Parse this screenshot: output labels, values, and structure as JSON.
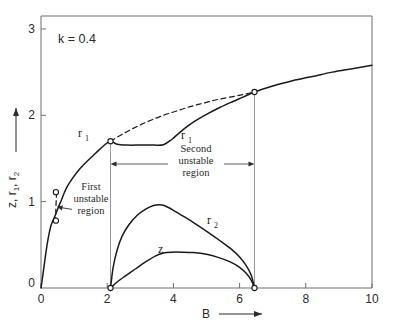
{
  "figure": {
    "background": "#ffffff",
    "ink": "#1a1a1a",
    "axis_color": "#6e6e6e"
  },
  "annotations": {
    "parameter": "k = 0.4",
    "first_region_line1": "First",
    "first_region_line2": "unstable",
    "first_region_line3": "region",
    "second_region_line1": "Second",
    "second_region_line2": "unstable",
    "second_region_line3": "region",
    "label_r1_left": "r",
    "label_r1_left_sub": "1",
    "label_r1_right": "r",
    "label_r1_right_sub": "1",
    "label_r2": "r",
    "label_r2_sub": "2",
    "label_z": "z"
  },
  "axes": {
    "x_title": "B",
    "y_title_parts": [
      "z",
      ", ",
      "r",
      "1",
      ", ",
      "r",
      "2"
    ],
    "y_title_flat": "z , r1 , r2",
    "x_ticks": [
      "0",
      "2",
      "4",
      "6",
      "8",
      "10"
    ],
    "y_ticks": [
      "0",
      "1",
      "2",
      "3"
    ],
    "x_origin_label": "0",
    "y_origin_label": "0"
  },
  "chart_data": {
    "type": "line",
    "title": "",
    "xlabel": "B",
    "ylabel": "z , r1 , r2",
    "xlim": [
      0,
      10
    ],
    "ylim": [
      0,
      3.15
    ],
    "grid": false,
    "legend": "inline-curve-labels",
    "x_ticks": [
      0,
      2,
      4,
      6,
      8,
      10
    ],
    "y_ticks": [
      0,
      1,
      2,
      3
    ],
    "parameter": {
      "name": "k",
      "value": 0.4
    },
    "unstable_regions": [
      {
        "name": "First unstable region",
        "type": "vertical-segment-on-r1",
        "B": 0.45,
        "z_range": [
          0.78,
          1.11
        ]
      },
      {
        "name": "Second unstable region",
        "type": "B-interval",
        "B_range": [
          2.1,
          6.45
        ]
      }
    ],
    "bifurcation_points": [
      {
        "B": 0.45,
        "value": 1.11,
        "marker": "open-circle"
      },
      {
        "B": 0.45,
        "value": 0.78,
        "marker": "open-circle"
      },
      {
        "B": 2.1,
        "value": 1.7,
        "marker": "open-circle"
      },
      {
        "B": 6.45,
        "value": 2.27,
        "marker": "open-circle"
      },
      {
        "B": 2.1,
        "value": 0.0,
        "marker": "open-circle"
      },
      {
        "B": 6.45,
        "value": 0.0,
        "marker": "open-circle"
      }
    ],
    "series": [
      {
        "name": "r1",
        "style": "solid",
        "comment": "stable lower branch; S-shaped rise then dip plateau then rise",
        "points": [
          [
            0.0,
            0.0
          ],
          [
            0.06,
            0.16
          ],
          [
            0.12,
            0.33
          ],
          [
            0.18,
            0.49
          ],
          [
            0.24,
            0.62
          ],
          [
            0.3,
            0.72
          ],
          [
            0.36,
            0.78
          ],
          [
            0.45,
            0.86
          ],
          [
            0.55,
            0.96
          ],
          [
            0.62,
            1.02
          ],
          [
            0.7,
            1.1
          ],
          [
            0.8,
            1.18
          ],
          [
            0.95,
            1.27
          ],
          [
            1.15,
            1.37
          ],
          [
            1.4,
            1.47
          ],
          [
            1.65,
            1.56
          ],
          [
            1.9,
            1.65
          ],
          [
            2.1,
            1.7
          ],
          [
            2.3,
            1.665
          ],
          [
            2.6,
            1.655
          ],
          [
            3.0,
            1.655
          ],
          [
            3.4,
            1.655
          ],
          [
            3.7,
            1.66
          ],
          [
            3.95,
            1.72
          ],
          [
            4.25,
            1.82
          ],
          [
            4.6,
            1.92
          ],
          [
            5.0,
            2.01
          ],
          [
            5.4,
            2.09
          ],
          [
            5.8,
            2.16
          ],
          [
            6.1,
            2.21
          ],
          [
            6.45,
            2.27
          ],
          [
            7.0,
            2.34
          ],
          [
            7.6,
            2.4
          ],
          [
            8.2,
            2.45
          ],
          [
            8.8,
            2.5
          ],
          [
            9.4,
            2.54
          ],
          [
            10.0,
            2.58
          ]
        ]
      },
      {
        "name": "r1-unstable-dashed",
        "style": "dashed",
        "comment": "unstable continuation of r1 across second unstable region",
        "points": [
          [
            2.1,
            1.7
          ],
          [
            2.5,
            1.79
          ],
          [
            2.9,
            1.87
          ],
          [
            3.3,
            1.94
          ],
          [
            3.7,
            2.0
          ],
          [
            4.1,
            2.05
          ],
          [
            4.5,
            2.1
          ],
          [
            4.9,
            2.14
          ],
          [
            5.3,
            2.18
          ],
          [
            5.7,
            2.21
          ],
          [
            6.1,
            2.24
          ],
          [
            6.45,
            2.27
          ]
        ]
      },
      {
        "name": "r1-first-unstable-dashed",
        "style": "dashed",
        "comment": "short dashed segment between the two open circles near B=0.45",
        "points": [
          [
            0.47,
            1.11
          ],
          [
            0.46,
            1.02
          ],
          [
            0.45,
            0.92
          ],
          [
            0.44,
            0.78
          ]
        ]
      },
      {
        "name": "r2",
        "style": "solid",
        "comment": "branch existing only inside second unstable region",
        "points": [
          [
            2.1,
            0.0
          ],
          [
            2.18,
            0.24
          ],
          [
            2.3,
            0.44
          ],
          [
            2.45,
            0.6
          ],
          [
            2.65,
            0.73
          ],
          [
            2.9,
            0.84
          ],
          [
            3.15,
            0.91
          ],
          [
            3.4,
            0.955
          ],
          [
            3.58,
            0.965
          ],
          [
            3.72,
            0.955
          ],
          [
            4.0,
            0.9
          ],
          [
            4.35,
            0.82
          ],
          [
            4.7,
            0.735
          ],
          [
            5.05,
            0.645
          ],
          [
            5.4,
            0.55
          ],
          [
            5.75,
            0.45
          ],
          [
            6.0,
            0.36
          ],
          [
            6.2,
            0.26
          ],
          [
            6.35,
            0.15
          ],
          [
            6.45,
            0.0
          ]
        ]
      },
      {
        "name": "z",
        "style": "solid",
        "comment": "lower branch inside second unstable region",
        "points": [
          [
            2.1,
            0.0
          ],
          [
            2.3,
            0.07
          ],
          [
            2.55,
            0.14
          ],
          [
            2.85,
            0.22
          ],
          [
            3.15,
            0.3
          ],
          [
            3.45,
            0.37
          ],
          [
            3.7,
            0.405
          ],
          [
            3.95,
            0.415
          ],
          [
            4.25,
            0.415
          ],
          [
            4.6,
            0.41
          ],
          [
            5.0,
            0.39
          ],
          [
            5.35,
            0.355
          ],
          [
            5.7,
            0.305
          ],
          [
            6.0,
            0.24
          ],
          [
            6.2,
            0.17
          ],
          [
            6.35,
            0.09
          ],
          [
            6.45,
            0.0
          ]
        ]
      }
    ]
  }
}
